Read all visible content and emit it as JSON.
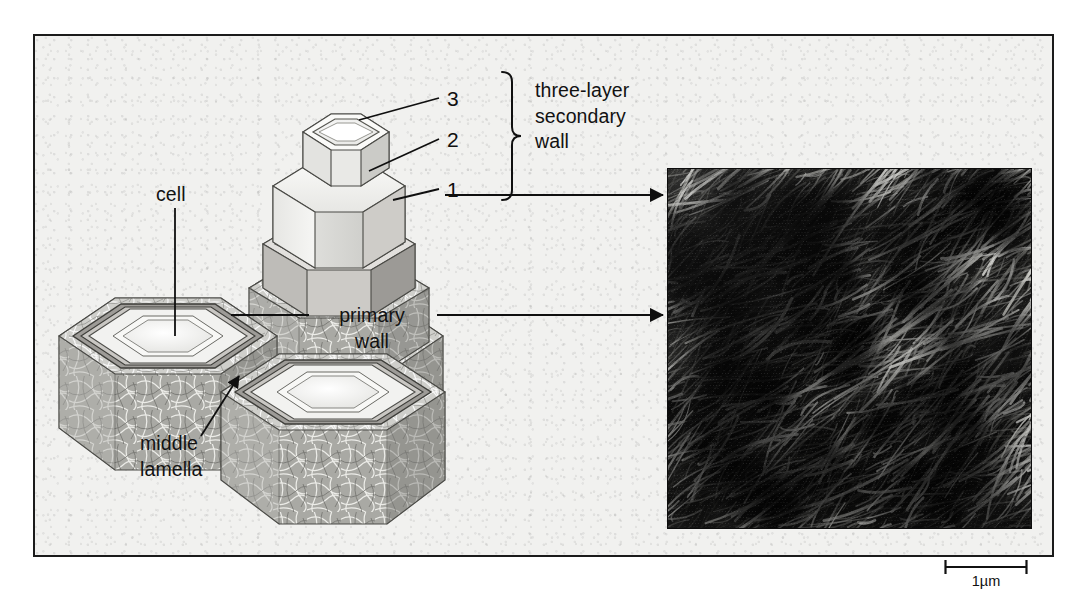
{
  "figure": {
    "caption_labels": {
      "cell": "cell",
      "middle_lamella": "middle\nlamella",
      "primary_wall": "primary\nwall",
      "secondary_wall": "three-layer\nsecondary\nwall"
    },
    "secondary_wall_layers": [
      {
        "id": "3",
        "label": "3"
      },
      {
        "id": "2",
        "label": "2"
      },
      {
        "id": "1",
        "label": "1"
      }
    ],
    "scale": {
      "label": "1µm",
      "bar_length_px": 84
    },
    "colors": {
      "background": "#f1f1ef",
      "frame_stroke": "#1b1b1b",
      "text": "#121212",
      "leader_line": "#0f0f0f",
      "wall_fill_light": "#f4f4f2",
      "wall_fill_mid": "#d9d9d6",
      "wall_fill_dark": "#b9b9b5",
      "lumen_fill": "#fbfbfa",
      "micrograph_dark": "#0a0a0a",
      "micrograph_fibril": "#e8e8e4"
    },
    "micrograph": {
      "description": "electron micrograph of cellulose microfibrils in primary wall"
    }
  }
}
